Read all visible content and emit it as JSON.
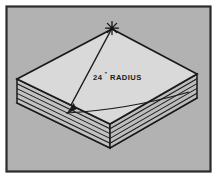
{
  "figure": {
    "frame": {
      "outer_background": "#ffffff",
      "border_color": "#2b2b2b",
      "panel_background": "#b2b2b2"
    },
    "annotation": {
      "value": "24",
      "unit_mark": "\"",
      "label": "RADIUS",
      "full_text": "24\" RADIUS",
      "text_color": "#1a1a1a"
    },
    "center_point": {
      "marker": "star-burst",
      "x": 112,
      "y": 28
    },
    "dimension_arrow": {
      "from_x": 112,
      "from_y": 29,
      "to_x": 68,
      "to_y": 111,
      "arrowhead": "filled-triangle",
      "line_color": "#1a1a1a"
    },
    "arc": {
      "description": "24 inch radius arc scribed across top face",
      "start_x": 66,
      "start_y": 113,
      "end_x": 189,
      "end_y": 92,
      "color": "#1a1a1a"
    },
    "stack": {
      "layer_count": 5,
      "top_face_color": "#d9d9d9",
      "left_face_color": "#c2c2c2",
      "right_face_color": "#bdbdbd",
      "edge_color": "#1a1a1a",
      "vertices": {
        "top_x": 112,
        "top_y": 29,
        "left_x": 17,
        "left_y": 79,
        "right_x": 197,
        "right_y": 74,
        "bottom_x": 110,
        "bottom_y": 124
      }
    }
  }
}
